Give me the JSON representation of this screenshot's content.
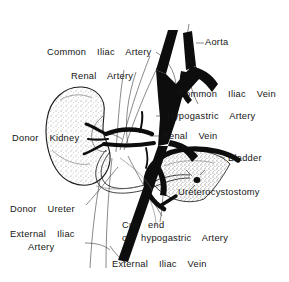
{
  "figure": {
    "type": "medical-line-illustration",
    "background_color": "#ffffff",
    "ink_color": "#101010",
    "stipple_color": "#8a8a8a",
    "width": 289,
    "height": 282
  },
  "labels": {
    "aorta": "Aorta",
    "common_iliac_artery": "Common  Iliac  Artery",
    "renal_artery": "Renal  Artery",
    "common_iliac_vein": "Common  Iliac  Vein",
    "hypogastric_artery": "Hypogastric  Artery",
    "donor_kidney": "Donor  Kidney",
    "renal_vein": "Renal  Vein",
    "bladder": "Bladder",
    "ureterocystostomy": "Ureterocystostomy",
    "donor_ureter": "Donor  Ureter",
    "external_iliac_artery_line1": "External  Iliac",
    "external_iliac_artery_line2": "Artery",
    "cut_end_line1": "Cut  end",
    "cut_end_line2": "of  hypogastric  Artery",
    "external_iliac_vein": "External  Iliac  Vein"
  },
  "structures": [
    {
      "name": "aorta",
      "kind": "artery",
      "fill": "solid-black"
    },
    {
      "name": "inferior-vena-cava",
      "kind": "vein",
      "fill": "solid-black"
    },
    {
      "name": "common-iliac-vessels",
      "kind": "vessel",
      "fill": "solid-black"
    },
    {
      "name": "hypogastric-artery",
      "kind": "artery",
      "fill": "solid-black"
    },
    {
      "name": "external-iliac-vessels",
      "kind": "vessel",
      "fill": "solid-black"
    },
    {
      "name": "donor-kidney",
      "kind": "organ",
      "fill": "stippled"
    },
    {
      "name": "renal-artery",
      "kind": "artery",
      "fill": "solid-black"
    },
    {
      "name": "renal-vein",
      "kind": "vein",
      "fill": "solid-black"
    },
    {
      "name": "donor-ureter",
      "kind": "tube",
      "fill": "outline"
    },
    {
      "name": "bladder",
      "kind": "organ",
      "fill": "stippled"
    },
    {
      "name": "ureterocystostomy",
      "kind": "anastomosis",
      "fill": "marker"
    }
  ]
}
